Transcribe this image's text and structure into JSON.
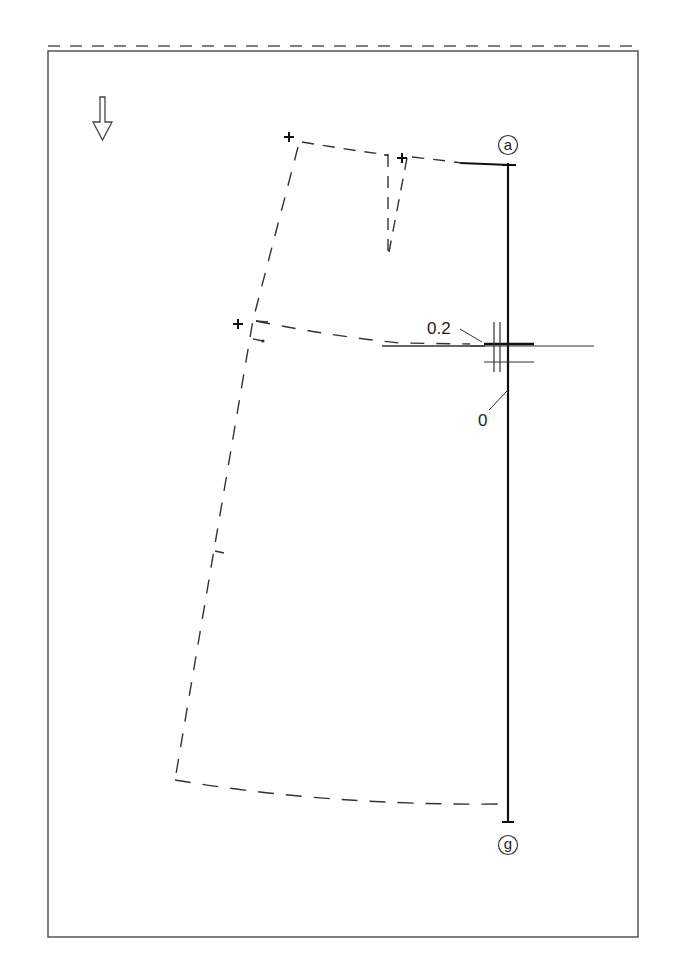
{
  "figure": {
    "type": "sewing-pattern-draft",
    "grain_arrow": "down",
    "points": {
      "top": "a",
      "bottom": "g"
    },
    "measurements": {
      "upper": "0.2",
      "lower": "0"
    },
    "colors": {
      "line": "#222222",
      "frame": "#555555",
      "background": "#ffffff"
    }
  }
}
